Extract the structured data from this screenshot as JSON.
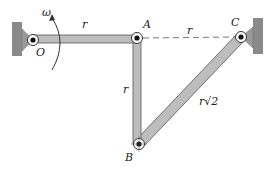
{
  "diagram": {
    "type": "four-bar linkage",
    "colors": {
      "link_fill": "#bdbdbd",
      "link_stroke": "#555555",
      "wall": "#8a8a8a",
      "dashed_line": "#777777",
      "text": "#222222"
    },
    "labels": {
      "omega": "ω",
      "O": "O",
      "A": "A",
      "B": "B",
      "C": "C",
      "link_OA": "r",
      "link_AC_dashed": "r",
      "link_AB": "r",
      "link_BC": "r√2"
    },
    "joints": [
      {
        "name": "O",
        "x": 33,
        "y": 40,
        "fixed": true
      },
      {
        "name": "A",
        "x": 137,
        "y": 38,
        "fixed": false
      },
      {
        "name": "B",
        "x": 139,
        "y": 144,
        "fixed": false
      },
      {
        "name": "C",
        "x": 241,
        "y": 37,
        "fixed": true
      }
    ],
    "links": [
      {
        "from": "O",
        "to": "A",
        "length_label": "r"
      },
      {
        "from": "A",
        "to": "B",
        "length_label": "r"
      },
      {
        "from": "B",
        "to": "C",
        "length_label": "r√2"
      }
    ],
    "reference_lines": [
      {
        "from": "A",
        "to": "C",
        "style": "dashed",
        "length_label": "r"
      }
    ],
    "angular_velocity": {
      "symbol": "ω",
      "about": "O",
      "direction": "counterclockwise"
    }
  }
}
